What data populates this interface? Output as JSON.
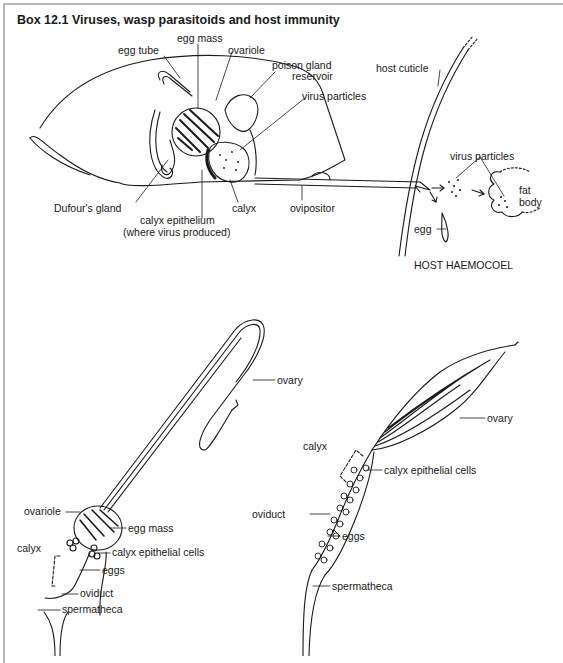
{
  "box": {
    "title": "Box 12.1  Viruses, wasp parasitoids and host immunity"
  },
  "top_diagram": {
    "labels": {
      "egg_mass": "egg mass",
      "egg_tube": "egg tube",
      "ovariole": "ovariole",
      "poison_gland_1": "poison gland",
      "poison_gland_2": "reservoir",
      "virus_particles_wasp": "virus particles",
      "host_cuticle": "host cuticle",
      "virus_particles_host": "virus particles",
      "fat_body_1": "fat",
      "fat_body_2": "body",
      "dufours_gland": "Dufour's gland",
      "calyx_epithelium_1": "calyx epithelium",
      "calyx_epithelium_2": "(where virus produced)",
      "calyx": "calyx",
      "ovipositor": "ovipositor",
      "egg": "egg",
      "host_haemocoel": "HOST HAEMOCOEL"
    }
  },
  "bottom_left_diagram": {
    "labels": {
      "ovary": "ovary",
      "ovariole": "ovariole",
      "egg_mass": "egg mass",
      "calyx": "calyx",
      "calyx_epithelial_cells": "calyx epithelial cells",
      "eggs": "eggs",
      "oviduct": "oviduct",
      "spermatheca": "spermatheca"
    }
  },
  "bottom_right_diagram": {
    "labels": {
      "ovary": "ovary",
      "calyx": "calyx",
      "calyx_epithelial_cells": "calyx epithelial cells",
      "oviduct": "oviduct",
      "eggs": "eggs",
      "spermatheca": "spermatheca"
    }
  }
}
